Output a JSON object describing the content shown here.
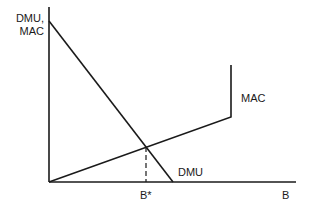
{
  "diagram": {
    "y_axis_label_line1": "DMU,",
    "y_axis_label_line2": "MAC",
    "x_axis_label": "B",
    "equilibrium_label": "B*",
    "curves": [
      {
        "name": "DMU",
        "label": "DMU",
        "description": "downward-sloping damage marginal utility line"
      },
      {
        "name": "MAC",
        "label": "MAC",
        "description": "upward-sloping marginal abatement cost line with vertical segment"
      }
    ],
    "colors": {
      "line": "#1a1a1a",
      "background": "#ffffff"
    }
  }
}
